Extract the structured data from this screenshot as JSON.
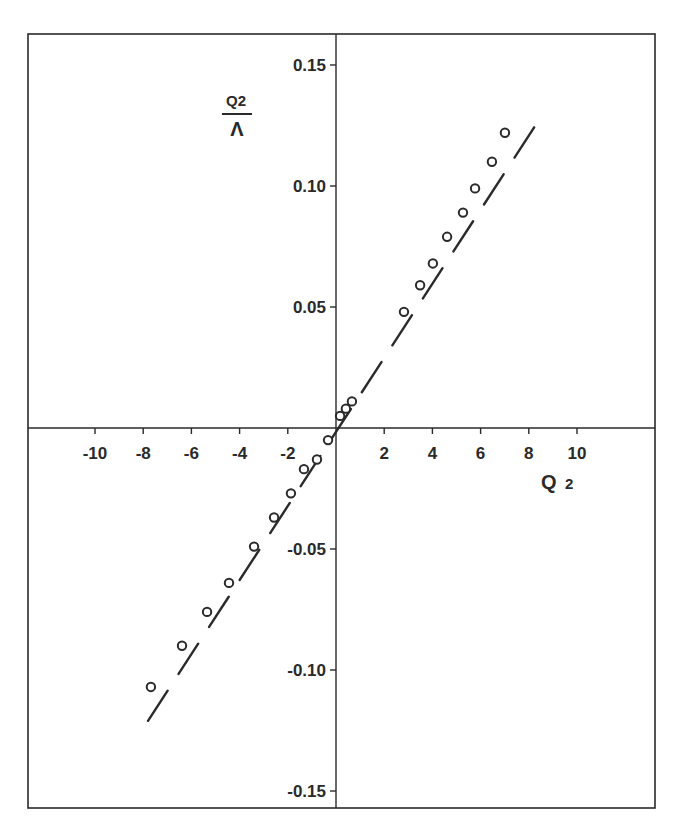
{
  "chart_data": {
    "type": "scatter",
    "title": "",
    "xlabel": "Q2",
    "ylabel": "Q2/Λ",
    "ylabel_parts": {
      "numerator": "Q2",
      "denominator": "Λ"
    },
    "xlim": [
      -12.5,
      13.5
    ],
    "ylim": [
      -0.157,
      0.162
    ],
    "grid": false,
    "legend": null,
    "x_ticks": [
      -10,
      -8,
      -6,
      -4,
      -2,
      2,
      4,
      6,
      8,
      10
    ],
    "x_tick_labels": [
      "-10",
      "-8",
      "-6",
      "-4",
      "-2",
      "2",
      "4",
      "6",
      "8",
      "10"
    ],
    "y_ticks": [
      0.15,
      0.1,
      0.05,
      -0.05,
      -0.1,
      -0.15
    ],
    "y_tick_labels": [
      "0.15",
      "0.10",
      "0.05",
      "-0.05",
      "-0.10",
      "-0.15"
    ],
    "series": [
      {
        "name": "measured",
        "style": "open-circle",
        "x": [
          -7.68,
          -6.39,
          -5.35,
          -4.44,
          -3.4,
          -2.57,
          -1.87,
          -1.33,
          -0.79,
          -0.33,
          0.17,
          0.41,
          0.66,
          2.82,
          3.49,
          4.02,
          4.61,
          5.27,
          5.77,
          6.47,
          7.01
        ],
        "y": [
          -0.107,
          -0.09,
          -0.076,
          -0.064,
          -0.049,
          -0.037,
          -0.027,
          -0.017,
          -0.013,
          -0.005,
          0.005,
          0.008,
          0.011,
          0.048,
          0.059,
          0.068,
          0.079,
          0.089,
          0.099,
          0.11,
          0.122
        ]
      },
      {
        "name": "fit",
        "style": "dashed-line",
        "x": [
          -7.8,
          8.6
        ],
        "y": [
          -0.121,
          0.13
        ]
      }
    ]
  },
  "layout": {
    "frame": {
      "left": 28,
      "top": 34,
      "right": 655,
      "bottom": 808
    },
    "origin_px": {
      "x": 336,
      "y": 428
    },
    "x_px_per_unit": 24.1,
    "y_px_per_unit": 2420
  },
  "labels": {
    "x_axis": {
      "main": "Q",
      "sub": "2"
    },
    "y_axis": {
      "numerator": "Q2",
      "denominator": "Λ"
    }
  },
  "colors": {
    "ink": "#2a2a2a",
    "background": "#ffffff"
  }
}
